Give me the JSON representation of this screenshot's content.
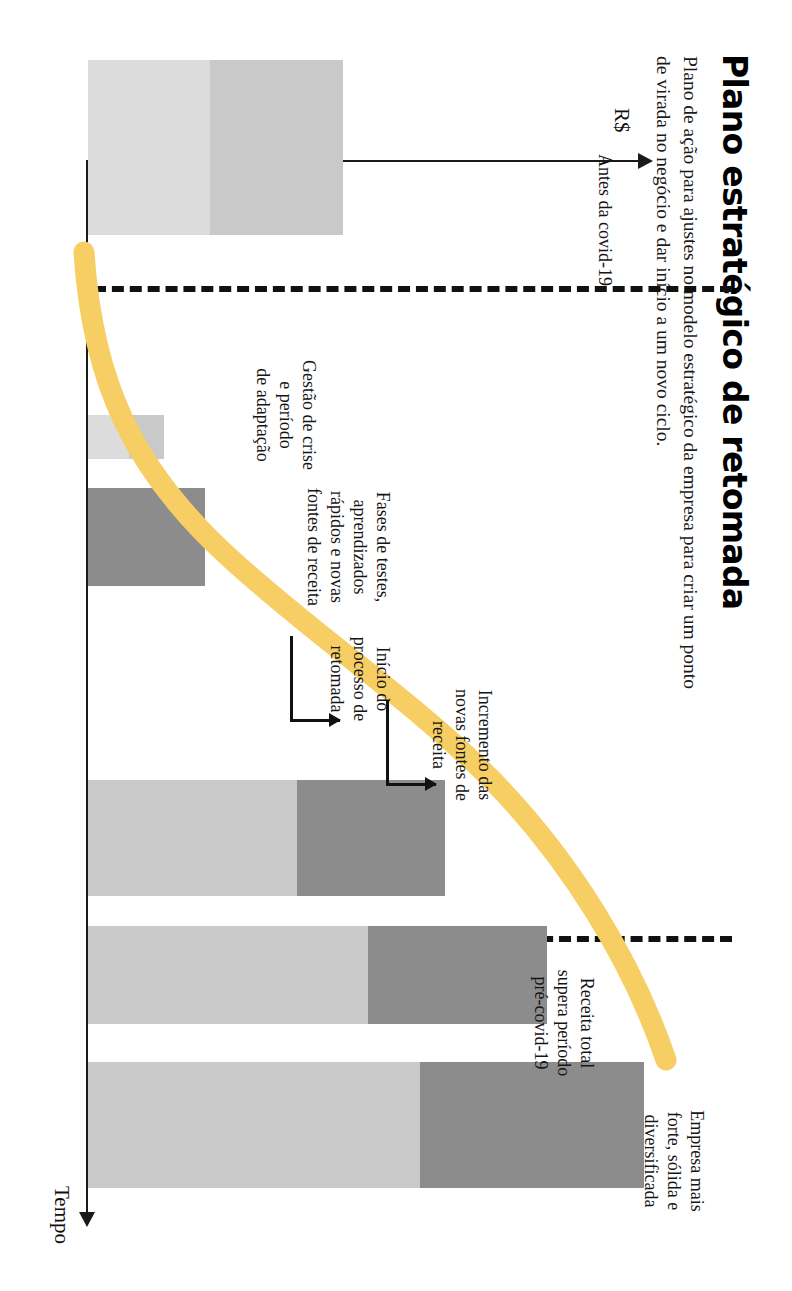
{
  "header": {
    "title": "Plano estratégico de retomada",
    "subtitle": "Plano de ação para ajustes no modelo estratégico da empresa para criar um ponto de virada no negócio e dar início a um novo ciclo."
  },
  "axes": {
    "value_label": "R$",
    "time_label": "Tempo"
  },
  "annotations": {
    "pre_covid": "Antes da covid-19",
    "crisis": "Gestão de crise\ne período\nde adaptação",
    "tests": "Fases de testes,\naprendizados\nrápidos e novas\nfontes de receita",
    "recovery_start": "Início do\nprocesso de\nretomada",
    "new_sources": "Incremento das\nnovas fontes de\nreceita",
    "revenue_exceeds": "Receita total\nsupera período\npré-covid-19",
    "stronger_company": "Empresa mais\nforte, sólida e\ndiversificada"
  },
  "colors": {
    "curve": "#F6CE63",
    "bar_dark": "#8C8C8C",
    "bar_mid": "#A8A8A8",
    "bar_light": "#C9C9C9",
    "bar_pale": "#DCDCDC",
    "ink": "#111111",
    "page": "#FFFFFF"
  },
  "chart_data": {
    "type": "bar",
    "title": "Plano estratégico de retomada",
    "xlabel": "Tempo",
    "ylabel": "R$",
    "grid": false,
    "legend": "none",
    "note": "Stacked composition bars along a time axis with an overlaid yellow recovery S-curve and a dashed pre/post covid-19 divider.",
    "divider": {
      "label": "Antes da covid-19",
      "x_index": 0.6
    },
    "categories": [
      "Antes da covid-19",
      "Gestão de crise e período de adaptação",
      "Fases de testes, aprendizados rápidos e novas fontes de receita",
      "Início do processo de retomada",
      "Incremento das novas fontes de receita",
      "Receita total supera período pré-covid-19",
      "Empresa mais forte, sólida e diversificada"
    ],
    "bars": [
      {
        "name": "Antes da covid-19",
        "x": 60,
        "width": 175,
        "segments": [
          {
            "tone": "bar_light",
            "value": 52
          },
          {
            "tone": "bar_pale",
            "value": 48
          }
        ],
        "total": 100
      },
      {
        "name": "Gestão de crise e período de adaptação",
        "x": 415,
        "width": 44,
        "segments": [
          {
            "tone": "bar_light",
            "value": 14
          },
          {
            "tone": "bar_pale",
            "value": 16
          }
        ],
        "total": 30
      },
      {
        "name": "Fases de testes, aprendizados rápidos e novas fontes de receita",
        "x": 488,
        "width": 98,
        "segments": [
          {
            "tone": "bar_dark",
            "value": 46
          }
        ],
        "total": 46
      },
      {
        "name": "Início do processo de retomada / incremento",
        "x": 780,
        "width": 116,
        "segments": [
          {
            "tone": "bar_dark",
            "value": 58
          },
          {
            "tone": "bar_light",
            "value": 82
          }
        ],
        "total": 140
      },
      {
        "name": "Receita total supera período pré-covid-19",
        "x": 926,
        "width": 98,
        "segments": [
          {
            "tone": "bar_dark",
            "value": 70
          },
          {
            "tone": "bar_light",
            "value": 110
          }
        ],
        "total": 180
      },
      {
        "name": "Empresa mais forte, sólida e diversificada",
        "x": 1062,
        "width": 126,
        "segments": [
          {
            "tone": "bar_dark",
            "value": 88
          },
          {
            "tone": "bar_light",
            "value": 130
          }
        ],
        "total": 218
      }
    ],
    "curve": {
      "name": "Curva de retomada",
      "color": "#F6CE63",
      "shape": "s-curve",
      "points": [
        {
          "x": 0.02,
          "y": 0.46
        },
        {
          "x": 0.18,
          "y": 0.36
        },
        {
          "x": 0.34,
          "y": 0.21
        },
        {
          "x": 0.48,
          "y": 0.1
        },
        {
          "x": 0.62,
          "y": 0.07
        },
        {
          "x": 0.8,
          "y": 0.25
        },
        {
          "x": 0.92,
          "y": 0.58
        },
        {
          "x": 1.0,
          "y": 0.86
        }
      ]
    }
  }
}
